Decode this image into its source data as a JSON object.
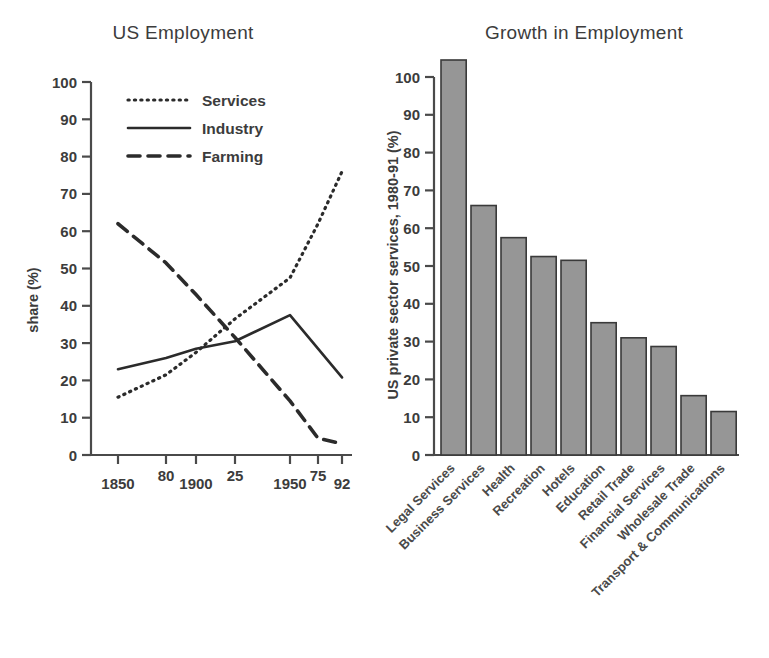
{
  "figure": {
    "background": "#ffffff",
    "ink_color": "#3c3c3c"
  },
  "left_panel": {
    "title": "US Employment",
    "ylabel": "share (%)",
    "legend": [
      {
        "label": "Services",
        "style": "dotted"
      },
      {
        "label": "Industry",
        "style": "solid"
      },
      {
        "label": "Farming",
        "style": "dashed"
      }
    ],
    "yticks": [
      "0",
      "10",
      "20",
      "30",
      "40",
      "50",
      "60",
      "70",
      "80",
      "90",
      "100"
    ],
    "xticks": [
      "1850",
      "80",
      "1900",
      "25",
      "1950",
      "75",
      "92"
    ]
  },
  "right_panel": {
    "title": "Growth in Employment",
    "ylabel": "US private sector services, 1980-91 (%)",
    "yticks": [
      "0",
      "10",
      "20",
      "30",
      "40",
      "50",
      "60",
      "70",
      "80",
      "90",
      "100"
    ],
    "bar_color": "#969696",
    "bar_edge_color": "#3a3a3a"
  },
  "chart_data": [
    {
      "id": "us-employment",
      "type": "line",
      "title": "US Employment",
      "xlabel": "",
      "ylabel": "share (%)",
      "ylim": [
        0,
        100
      ],
      "yticks": [
        0,
        10,
        20,
        30,
        40,
        50,
        60,
        70,
        80,
        90,
        100
      ],
      "x": [
        1850,
        1880,
        1900,
        1925,
        1950,
        1975,
        1992
      ],
      "xtick_labels": [
        "1850",
        "80",
        "1900",
        "25",
        "1950",
        "75",
        "92"
      ],
      "grid": false,
      "legend_position": "upper-left-inside",
      "series": [
        {
          "name": "Services",
          "style": "dotted",
          "color": "#2b2b2b",
          "values": [
            15.5,
            21.5,
            27.5,
            36.5,
            47.5,
            62.0,
            76.0
          ]
        },
        {
          "name": "Industry",
          "style": "solid",
          "color": "#2b2b2b",
          "values": [
            23.0,
            26.0,
            28.5,
            30.5,
            37.5,
            28.5,
            20.8
          ]
        },
        {
          "name": "Farming",
          "style": "dashed",
          "color": "#2b2b2b",
          "values": [
            62.0,
            51.5,
            43.0,
            31.5,
            14.5,
            4.5,
            3.0
          ]
        }
      ]
    },
    {
      "id": "growth-in-employment",
      "type": "bar",
      "title": "Growth in Employment",
      "xlabel": "",
      "ylabel": "US private sector services, 1980-91 (%)",
      "ylim": [
        0,
        105
      ],
      "yticks": [
        0,
        10,
        20,
        30,
        40,
        50,
        60,
        70,
        80,
        90,
        100
      ],
      "grid": false,
      "categories": [
        "Legal Services",
        "Business Services",
        "Health",
        "Recreation",
        "Hotels",
        "Education",
        "Retail Trade",
        "Financial Services",
        "Wholesale Trade",
        "Transport & Communications"
      ],
      "values": [
        104.5,
        66.0,
        57.5,
        52.5,
        51.5,
        35.0,
        31.0,
        28.7,
        15.7,
        11.5
      ]
    }
  ]
}
